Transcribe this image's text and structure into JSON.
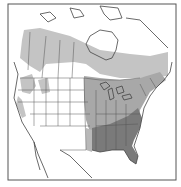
{
  "map": {
    "type": "range-map",
    "region": "North America",
    "legend": [],
    "colors": {
      "background": "#ffffff",
      "frame": "#555555",
      "border": "#444444",
      "range_light": "#c4c4c4",
      "range_mid": "#a8a8a8",
      "range_dark": "#7a7a7a"
    },
    "zones": [
      {
        "name": "northern-range",
        "shade": "light",
        "description": "Band across southern Canada from Alaska border to Atlantic provinces"
      },
      {
        "name": "eastern-range",
        "shade": "mid",
        "description": "Eastern United States, Great Lakes, Midwest"
      },
      {
        "name": "southeastern-core-range",
        "shade": "dark",
        "description": "Southeastern United States including Florida and Gulf states"
      },
      {
        "name": "western-patches",
        "shade": "light",
        "description": "Scattered Pacific Northwest and mountain patches"
      }
    ]
  }
}
